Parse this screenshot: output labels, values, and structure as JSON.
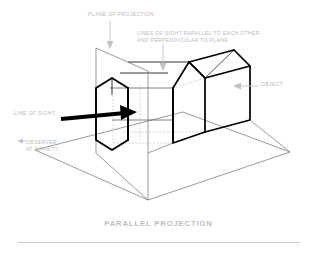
{
  "figure": {
    "title": "PARALLEL PROJECTION",
    "background_color": "#ffffff",
    "annotation_color": "#b9b9b9",
    "line_color": "#000000",
    "thin_line_color": "#555555",
    "hidden_line_color": "#aaaaaa",
    "labels": {
      "plane_of_projection": "PLANE OF PROJECTION",
      "lines_of_sight": "LINES OF SIGHT PARALLEL TO EACH OTHER\nAND PERPENDICULAR TO PLANE",
      "object": "OBJECT",
      "line_of_sight": "LINE OF SIGHT",
      "observer_at_infinity": "OBSERVER\nAT INFINITY"
    },
    "diagram": {
      "type": "technical-illustration",
      "subject": "parallel (orthographic) projection of a house-shaped solid onto a picture plane",
      "elements": [
        "ground-plane",
        "projection-plane",
        "projected-image-outline",
        "object-solid",
        "sight-lines",
        "line-of-sight-arrow"
      ]
    }
  }
}
